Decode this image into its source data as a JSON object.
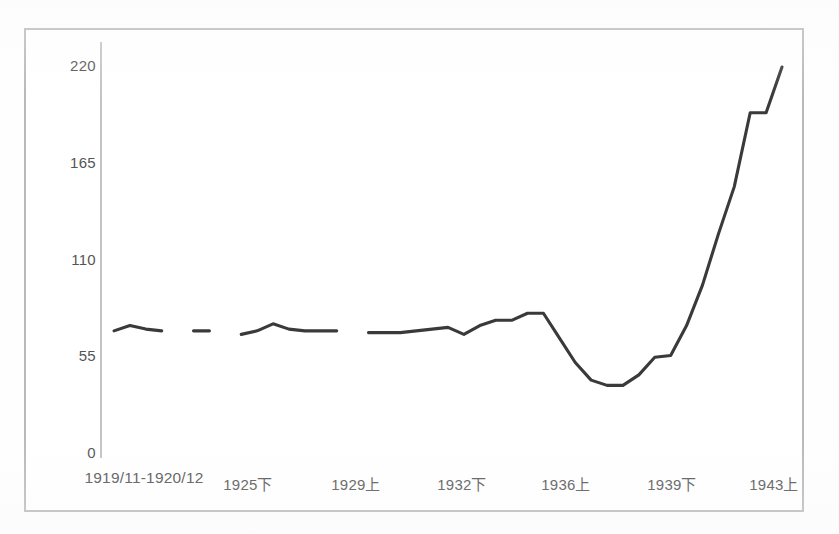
{
  "chart_data": {
    "type": "line",
    "title": "",
    "subtitle": "",
    "xlabel": "",
    "ylabel": "",
    "ylim": [
      0,
      220
    ],
    "grid": false,
    "legend": null,
    "y_ticks": [
      "0",
      "55",
      "110",
      "165",
      "220"
    ],
    "y_tick_values": [
      0,
      55,
      110,
      165,
      220
    ],
    "x_tick_labels": [
      "1919/11-1920/12",
      "1925下",
      "1929上",
      "1932下",
      "1936上",
      "1939下",
      "1943上"
    ],
    "series": [
      {
        "name": "series-1",
        "color": "#3a3a3a",
        "has_gaps": true,
        "points": [
          {
            "x": 0.0,
            "y": 70
          },
          {
            "x": 1.0,
            "y": 73
          },
          {
            "x": 2.0,
            "y": 71
          },
          {
            "x": 3.0,
            "y": 70
          },
          {
            "x": 4.0,
            "y": null
          },
          {
            "x": 5.0,
            "y": 70
          },
          {
            "x": 6.0,
            "y": 70
          },
          {
            "x": 7.0,
            "y": null
          },
          {
            "x": 8.0,
            "y": 68
          },
          {
            "x": 9.0,
            "y": 70
          },
          {
            "x": 10.0,
            "y": 74
          },
          {
            "x": 11.0,
            "y": 71
          },
          {
            "x": 12.0,
            "y": 70
          },
          {
            "x": 13.0,
            "y": 70
          },
          {
            "x": 14.0,
            "y": 70
          },
          {
            "x": 15.0,
            "y": null
          },
          {
            "x": 16.0,
            "y": 69
          },
          {
            "x": 17.0,
            "y": 69
          },
          {
            "x": 18.0,
            "y": 69
          },
          {
            "x": 19.0,
            "y": 70
          },
          {
            "x": 20.0,
            "y": 71
          },
          {
            "x": 21.0,
            "y": 72
          },
          {
            "x": 22.0,
            "y": 68
          },
          {
            "x": 23.0,
            "y": 73
          },
          {
            "x": 24.0,
            "y": 76
          },
          {
            "x": 25.0,
            "y": 76
          },
          {
            "x": 26.0,
            "y": 80
          },
          {
            "x": 27.0,
            "y": 80
          },
          {
            "x": 28.0,
            "y": 66
          },
          {
            "x": 29.0,
            "y": 52
          },
          {
            "x": 30.0,
            "y": 42
          },
          {
            "x": 31.0,
            "y": 39
          },
          {
            "x": 32.0,
            "y": 39
          },
          {
            "x": 33.0,
            "y": 45
          },
          {
            "x": 34.0,
            "y": 55
          },
          {
            "x": 35.0,
            "y": 56
          },
          {
            "x": 36.0,
            "y": 73
          },
          {
            "x": 37.0,
            "y": 96
          },
          {
            "x": 38.0,
            "y": 125
          },
          {
            "x": 39.0,
            "y": 152
          },
          {
            "x": 40.0,
            "y": 194
          },
          {
            "x": 41.0,
            "y": 194
          },
          {
            "x": 42.0,
            "y": 220
          }
        ]
      }
    ]
  },
  "style": {
    "frame_border_color": "#b9b9b9",
    "axis_color": "#c4c4c4",
    "line_color": "#3a3a3a",
    "text_color": "#555555",
    "background": "#ffffff"
  }
}
